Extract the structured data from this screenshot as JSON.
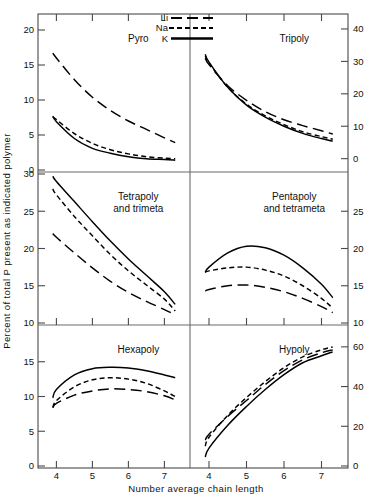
{
  "chart_data": {
    "type": "line",
    "title": "",
    "xlabel": "Number average chain length",
    "ylabel": "Percent of total P present as indicated polymer",
    "legend": {
      "position": "top-center",
      "entries": [
        {
          "name": "Li",
          "style": "long-dash"
        },
        {
          "name": "Na",
          "style": "short-dash"
        },
        {
          "name": "K",
          "style": "solid"
        }
      ]
    },
    "grid": false,
    "x": [
      3.9,
      4.0,
      4.5,
      5.0,
      5.5,
      6.0,
      6.5,
      7.0,
      7.3
    ],
    "xlim": [
      3.6,
      7.6
    ],
    "xticks": [
      4,
      5,
      6,
      7
    ],
    "panels": [
      {
        "id": "pyro",
        "label": "Pyro",
        "row": 0,
        "col": 0,
        "axis_side": "left",
        "ylim": [
          0,
          22
        ],
        "yticks": [
          0,
          5,
          10,
          15,
          20
        ],
        "series": [
          {
            "name": "Li",
            "style": "long-dash",
            "values": [
              16.7,
              16.0,
              12.9,
              10.4,
              8.5,
              7.0,
              5.8,
              4.6,
              3.9
            ]
          },
          {
            "name": "Na",
            "style": "short-dash",
            "values": [
              7.6,
              7.2,
              5.2,
              3.8,
              2.9,
              2.3,
              1.9,
              1.7,
              1.6
            ]
          },
          {
            "name": "K",
            "style": "solid",
            "values": [
              7.7,
              6.9,
              4.5,
              3.1,
              2.4,
              1.9,
              1.6,
              1.5,
              1.4
            ]
          }
        ]
      },
      {
        "id": "tripoly",
        "label": "Tripoly",
        "row": 0,
        "col": 1,
        "axis_side": "right",
        "ylim": [
          -3.5,
          44
        ],
        "yticks": [
          0,
          10,
          20,
          30,
          40
        ],
        "series": [
          {
            "name": "Li",
            "style": "long-dash",
            "values": [
              31.0,
              29.0,
              22.5,
              18.0,
              14.5,
              12.0,
              10.2,
              8.6,
              7.6
            ]
          },
          {
            "name": "Na",
            "style": "short-dash",
            "values": [
              31.8,
              29.5,
              22.0,
              16.8,
              13.2,
              10.5,
              8.3,
              6.8,
              6.0
            ]
          },
          {
            "name": "K",
            "style": "solid",
            "values": [
              32.2,
              29.8,
              22.0,
              16.5,
              12.8,
              10.0,
              7.8,
              6.2,
              5.4
            ]
          }
        ]
      },
      {
        "id": "tetrapoly",
        "label": "Tetrapoly\nand trimeta",
        "label_line1": "Tetrapoly",
        "label_line2": "and  trimeta",
        "row": 1,
        "col": 0,
        "axis_side": "left",
        "ylim": [
          10,
          30
        ],
        "yticks": [
          10,
          15,
          20,
          25,
          30
        ],
        "series": [
          {
            "name": "Li",
            "style": "long-dash",
            "values": [
              22.0,
              21.5,
              19.4,
              17.4,
              15.6,
              14.1,
              12.9,
              11.8,
              11.1
            ]
          },
          {
            "name": "Na",
            "style": "short-dash",
            "values": [
              28.0,
              27.2,
              24.3,
              21.7,
              19.2,
              17.0,
              15.1,
              13.2,
              11.6
            ]
          },
          {
            "name": "K",
            "style": "solid",
            "values": [
              29.7,
              29.0,
              26.3,
              23.6,
              21.0,
              18.6,
              16.4,
              14.2,
              12.5
            ]
          }
        ]
      },
      {
        "id": "pentapoly",
        "label": "Pentapoly\nand tetrameta",
        "label_line1": "Pentapoly",
        "label_line2": "and  tetrameta",
        "row": 1,
        "col": 1,
        "axis_side": "right",
        "ylim": [
          10,
          30
        ],
        "yticks": [
          10,
          15,
          20,
          25
        ],
        "series": [
          {
            "name": "Li",
            "style": "long-dash",
            "values": [
              14.3,
              14.5,
              15.0,
              15.1,
              14.8,
              14.2,
              13.3,
              12.2,
              11.4
            ]
          },
          {
            "name": "Na",
            "style": "short-dash",
            "values": [
              16.8,
              17.0,
              17.4,
              17.5,
              17.1,
              16.3,
              15.0,
              13.3,
              12.0
            ]
          },
          {
            "name": "K",
            "style": "solid",
            "values": [
              16.8,
              17.5,
              19.4,
              20.3,
              20.1,
              19.1,
              17.4,
              15.2,
              13.4
            ]
          }
        ]
      },
      {
        "id": "hexapoly",
        "label": "Hexapoly",
        "row": 2,
        "col": 0,
        "axis_side": "left",
        "ylim": [
          0,
          20
        ],
        "yticks": [
          0,
          5,
          10,
          15
        ],
        "series": [
          {
            "name": "Li",
            "style": "long-dash",
            "values": [
              8.4,
              9.0,
              10.2,
              10.8,
              11.1,
              11.0,
              10.7,
              10.1,
              9.5
            ]
          },
          {
            "name": "Na",
            "style": "short-dash",
            "values": [
              8.4,
              9.4,
              11.4,
              12.4,
              12.7,
              12.5,
              11.9,
              10.8,
              10.0
            ]
          },
          {
            "name": "K",
            "style": "solid",
            "values": [
              9.8,
              11.0,
              13.1,
              14.0,
              14.2,
              14.1,
              13.7,
              13.1,
              12.7
            ]
          }
        ]
      },
      {
        "id": "hypoly",
        "label": "Hypoly",
        "row": 2,
        "col": 1,
        "axis_side": "right",
        "ylim": [
          0,
          70
        ],
        "yticks": [
          0,
          20,
          40,
          60
        ],
        "series": [
          {
            "name": "Li",
            "style": "long-dash",
            "values": [
              13.0,
              16.0,
              25.0,
              33.0,
              41.0,
              48.0,
              53.5,
              57.0,
              58.5
            ]
          },
          {
            "name": "Na",
            "style": "short-dash",
            "values": [
              10.0,
              14.5,
              25.5,
              34.5,
              42.5,
              49.5,
              55.0,
              58.5,
              60.0
            ]
          },
          {
            "name": "K",
            "style": "solid",
            "values": [
              4.5,
              9.0,
              20.5,
              30.0,
              38.5,
              46.0,
              52.0,
              55.5,
              57.5
            ]
          }
        ]
      }
    ]
  },
  "axes": {
    "x_title": "Number average chain length",
    "y_title": "Percent of total P present as indicated polymer",
    "x_tick_labels_left": [
      "4",
      "5",
      "6",
      "7"
    ],
    "x_tick_labels_right": [
      "4",
      "5",
      "6",
      "7"
    ],
    "left_labels_row0": [
      "20",
      "15",
      "10",
      "5",
      "0"
    ],
    "left_labels_row1": [
      "25",
      "20",
      "15",
      "10"
    ],
    "left_labels_row2": [
      "15",
      "10",
      "5",
      "0"
    ],
    "right_labels_row0": [
      "40",
      "30",
      "20",
      "10",
      "0"
    ],
    "right_labels_row1": [
      "25",
      "20",
      "15",
      "10"
    ],
    "right_labels_row2": [
      "60",
      "40",
      "20",
      "0"
    ]
  },
  "legend": {
    "items": [
      {
        "label": "Li"
      },
      {
        "label": "Na"
      },
      {
        "label": "K"
      }
    ]
  },
  "panel_labels": {
    "pyro": "Pyro",
    "tripoly": "Tripoly",
    "tetrapoly_l1": "Tetrapoly",
    "tetrapoly_l2": "and  trimeta",
    "pentapoly_l1": "Pentapoly",
    "pentapoly_l2": "and  tetrameta",
    "hexapoly": "Hexapoly",
    "hypoly": "Hypoly"
  },
  "colors": {
    "line": "#000000",
    "frame": "#4a4a4a",
    "background": "#ffffff"
  }
}
